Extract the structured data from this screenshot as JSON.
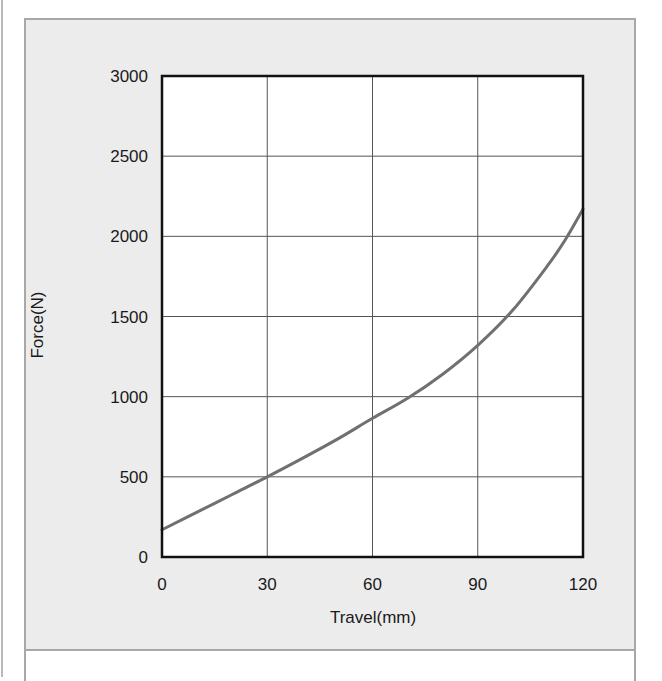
{
  "chart_data": {
    "type": "line",
    "title": "",
    "xlabel": "Travel(mm)",
    "ylabel": "Force(N)",
    "xlim": [
      0,
      120
    ],
    "ylim": [
      0,
      3000
    ],
    "xticks": [
      0,
      30,
      60,
      90,
      120
    ],
    "yticks": [
      0,
      500,
      1000,
      1500,
      2000,
      2500,
      3000
    ],
    "grid": true,
    "legend": null,
    "series": [
      {
        "name": "Force vs Travel",
        "color": "#707070",
        "x": [
          0,
          10,
          20,
          30,
          40,
          50,
          60,
          70,
          80,
          90,
          100,
          110,
          115,
          120
        ],
        "y": [
          170,
          280,
          390,
          500,
          615,
          735,
          865,
          990,
          1140,
          1320,
          1540,
          1820,
          1980,
          2170
        ]
      }
    ]
  },
  "colors": {
    "panel_bg": "#ececec",
    "panel_border": "#a8a8a8",
    "plot_bg": "#ffffff",
    "grid": "#555555",
    "frame": "#111111",
    "curve": "#707070"
  }
}
